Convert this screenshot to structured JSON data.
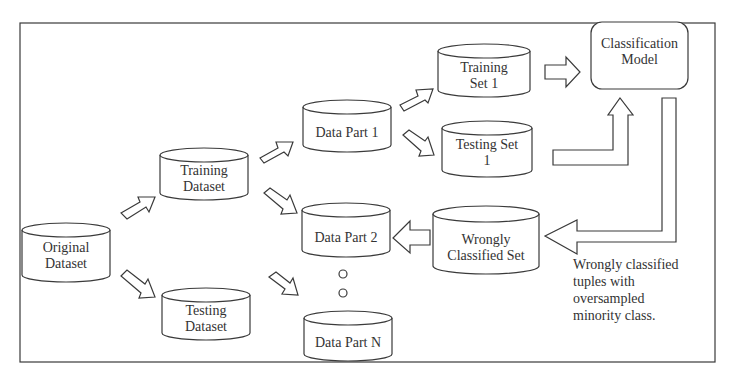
{
  "diagram": {
    "type": "flowchart",
    "nodes": {
      "original_dataset": {
        "label_line1": "Original",
        "label_line2": "Dataset",
        "shape": "cylinder"
      },
      "training_dataset": {
        "label_line1": "Training",
        "label_line2": "Dataset",
        "shape": "cylinder"
      },
      "testing_dataset": {
        "label_line1": "Testing",
        "label_line2": "Dataset",
        "shape": "cylinder"
      },
      "data_part_1": {
        "label": "Data Part 1",
        "shape": "cylinder"
      },
      "data_part_2": {
        "label": "Data Part 2",
        "shape": "cylinder"
      },
      "data_part_n": {
        "label": "Data Part N",
        "shape": "cylinder"
      },
      "training_set_1": {
        "label_line1": "Training",
        "label_line2": "Set 1",
        "shape": "cylinder"
      },
      "testing_set_1": {
        "label_line1": "Testing Set",
        "label_line2": "1",
        "shape": "cylinder"
      },
      "classification_model": {
        "label_line1": "Classification",
        "label_line2": "Model",
        "shape": "rounded-rectangle"
      },
      "wrongly_classified_set": {
        "label_line1": "Wrongly",
        "label_line2": "Classified Set",
        "shape": "cylinder"
      }
    },
    "edges": [
      {
        "from": "Original Dataset",
        "to": "Training Dataset"
      },
      {
        "from": "Original Dataset",
        "to": "Testing Dataset"
      },
      {
        "from": "Training Dataset",
        "to": "Data Part 1"
      },
      {
        "from": "Training Dataset",
        "to": "Data Part 2"
      },
      {
        "from": "Training Dataset",
        "to": "Data Part N"
      },
      {
        "from": "Data Part 1",
        "to": "Training Set 1"
      },
      {
        "from": "Data Part 1",
        "to": "Testing Set 1"
      },
      {
        "from": "Training Set 1",
        "to": "Classification Model"
      },
      {
        "from": "Testing Set 1",
        "to": "Classification Model"
      },
      {
        "from": "Classification Model",
        "to": "Wrongly Classified Set"
      },
      {
        "from": "Wrongly Classified Set",
        "to": "Data Part 2"
      }
    ],
    "annotation": {
      "line1": "Wrongly classified",
      "line2": "tuples with",
      "line3": "oversampled",
      "line4": "minority class."
    },
    "colors": {
      "stroke": "#3a3a3a",
      "fill": "#ffffff",
      "background": "#ffffff"
    }
  }
}
